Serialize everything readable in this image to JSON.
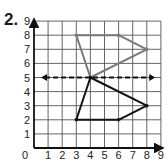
{
  "problem": {
    "number_label": "2."
  },
  "chart_data": {
    "type": "coordinate-grid",
    "title": "",
    "xlabel": "",
    "ylabel": "",
    "xlim": [
      0,
      9
    ],
    "ylim": [
      0,
      9
    ],
    "grid": true,
    "x_ticks": [
      "0",
      "1",
      "2",
      "3",
      "4",
      "5",
      "6",
      "7",
      "8",
      "9"
    ],
    "y_ticks": [
      "1",
      "2",
      "3",
      "4",
      "5",
      "6",
      "7",
      "8",
      "9"
    ],
    "shapes": [
      {
        "name": "original-figure",
        "color": "#7a7a7a",
        "closed": true,
        "vertices": [
          [
            3,
            8
          ],
          [
            6,
            8
          ],
          [
            8,
            7
          ],
          [
            4,
            5
          ]
        ]
      },
      {
        "name": "reflected-figure",
        "color": "#111111",
        "closed": true,
        "vertices": [
          [
            3,
            2
          ],
          [
            6,
            2
          ],
          [
            8,
            3
          ],
          [
            4,
            5
          ]
        ]
      }
    ],
    "line_of_reflection": {
      "y": 5,
      "x_from": 0.5,
      "x_to": 8.6,
      "style": "dashed",
      "arrows": "both",
      "color": "#111111"
    }
  },
  "colors": {
    "grid": "#555555",
    "axis": "#111111",
    "background": "#ffffff"
  }
}
